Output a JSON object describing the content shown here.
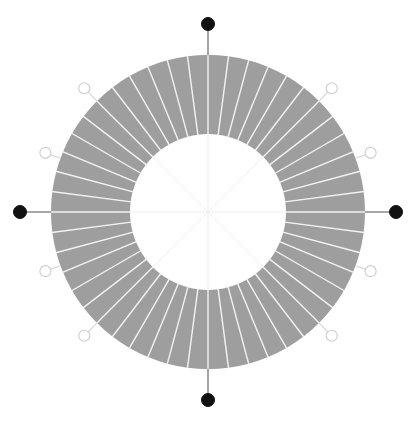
{
  "figure": {
    "type": "polar-donut-diagram",
    "title": "",
    "width": 418,
    "height": 429,
    "background_color": "#ffffff",
    "center": {
      "x": 208,
      "y": 212
    },
    "outer_radius": 157,
    "inner_radius": 78,
    "segment_count": 48,
    "segment_angle_deg": 7.5,
    "ring_fill_color": "#9e9e9e",
    "segment_divider_color": "#f2f2f2",
    "segment_divider_width": 1.4,
    "crosshair_color": "#ededed",
    "crosshair_width": 1,
    "crosshair_angles_deg": [
      0,
      45,
      90,
      135,
      180,
      225,
      270,
      315
    ]
  },
  "chart_data": {
    "type": "pie",
    "title": "",
    "subtitle": "",
    "xlabel": "",
    "ylabel": "",
    "legend_position": "none",
    "grid": false,
    "inner_radius_ratio": 0.497,
    "categories": [
      "s01",
      "s02",
      "s03",
      "s04",
      "s05",
      "s06",
      "s07",
      "s08",
      "s09",
      "s10",
      "s11",
      "s12",
      "s13",
      "s14",
      "s15",
      "s16",
      "s17",
      "s18",
      "s19",
      "s20",
      "s21",
      "s22",
      "s23",
      "s24",
      "s25",
      "s26",
      "s27",
      "s28",
      "s29",
      "s30",
      "s31",
      "s32",
      "s33",
      "s34",
      "s35",
      "s36",
      "s37",
      "s38",
      "s39",
      "s40",
      "s41",
      "s42",
      "s43",
      "s44",
      "s45",
      "s46",
      "s47",
      "s48"
    ],
    "values": [
      7.5,
      7.5,
      7.5,
      7.5,
      7.5,
      7.5,
      7.5,
      7.5,
      7.5,
      7.5,
      7.5,
      7.5,
      7.5,
      7.5,
      7.5,
      7.5,
      7.5,
      7.5,
      7.5,
      7.5,
      7.5,
      7.5,
      7.5,
      7.5,
      7.5,
      7.5,
      7.5,
      7.5,
      7.5,
      7.5,
      7.5,
      7.5,
      7.5,
      7.5,
      7.5,
      7.5,
      7.5,
      7.5,
      7.5,
      7.5,
      7.5,
      7.5,
      7.5,
      7.5,
      7.5,
      7.5,
      7.5,
      7.5
    ],
    "units": "degrees",
    "total": 360,
    "slice_color": "#9e9e9e"
  },
  "markers": {
    "filled_style": {
      "fill": "#111111",
      "stroke": "#111111",
      "radius": 6.5,
      "stem_color": "#6b6b6b",
      "stem_width": 1.2
    },
    "open_style": {
      "fill": "#ffffff",
      "stroke": "#cfcfcf",
      "radius": 5.5,
      "stroke_width": 1.2,
      "stem_color": "#d5d5d5",
      "stem_width": 1.1
    },
    "items": [
      {
        "name": "marker-north",
        "angle_deg": 90,
        "kind": "filled",
        "label": "",
        "stem_length": 31,
        "marker_radius_px": 188
      },
      {
        "name": "marker-east",
        "angle_deg": 0,
        "kind": "filled",
        "label": "",
        "stem_length": 31,
        "marker_radius_px": 188
      },
      {
        "name": "marker-south",
        "angle_deg": 270,
        "kind": "filled",
        "label": "",
        "stem_length": 31,
        "marker_radius_px": 188
      },
      {
        "name": "marker-west",
        "angle_deg": 180,
        "kind": "filled",
        "label": "",
        "stem_length": 31,
        "marker_radius_px": 188
      },
      {
        "name": "marker-northeast",
        "angle_deg": 45,
        "kind": "open",
        "label": "",
        "stem_length": 18,
        "marker_radius_px": 175
      },
      {
        "name": "marker-northwest",
        "angle_deg": 135,
        "kind": "open",
        "label": "",
        "stem_length": 18,
        "marker_radius_px": 175
      },
      {
        "name": "marker-southwest",
        "angle_deg": 225,
        "kind": "open",
        "label": "",
        "stem_length": 18,
        "marker_radius_px": 175
      },
      {
        "name": "marker-southeast",
        "angle_deg": 315,
        "kind": "open",
        "label": "",
        "stem_length": 18,
        "marker_radius_px": 175
      },
      {
        "name": "marker-east-north",
        "angle_deg": 20,
        "kind": "open",
        "label": "",
        "stem_length": 16,
        "marker_radius_px": 173
      },
      {
        "name": "marker-west-north",
        "angle_deg": 160,
        "kind": "open",
        "label": "",
        "stem_length": 16,
        "marker_radius_px": 173
      },
      {
        "name": "marker-west-south",
        "angle_deg": 200,
        "kind": "open",
        "label": "",
        "stem_length": 16,
        "marker_radius_px": 173
      },
      {
        "name": "marker-east-south",
        "angle_deg": 340,
        "kind": "open",
        "label": "",
        "stem_length": 16,
        "marker_radius_px": 173
      }
    ]
  }
}
